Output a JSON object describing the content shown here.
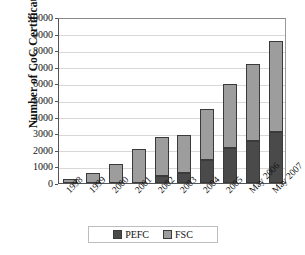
{
  "chart_data": {
    "type": "bar",
    "subtype": "stacked-bar",
    "title": "",
    "xlabel": "",
    "ylabel": "Number of CoC Certificates",
    "ylim": [
      0,
      10000
    ],
    "ytick_step": 1000,
    "yticks": [
      0,
      1000,
      2000,
      3000,
      4000,
      5000,
      6000,
      7000,
      8000,
      9000,
      10000
    ],
    "ytick_labels": [
      "0",
      "1000",
      "2000",
      "3000",
      "4000",
      "5000",
      "6000",
      "7000",
      "8000",
      "9000",
      "10000"
    ],
    "grid": true,
    "grid_axis": "y",
    "legend": [
      "PEFC",
      "FSC"
    ],
    "legend_position": "bottom-center",
    "categories": [
      "1998",
      "1999",
      "2000",
      "2001",
      "2002",
      "2003",
      "2004",
      "2005",
      "May 2006",
      "May 2007"
    ],
    "series": [
      {
        "name": "PEFC",
        "color": "#4a4a4a",
        "values": [
          0,
          0,
          0,
          0,
          430,
          580,
          1380,
          2100,
          2520,
          3100
        ]
      },
      {
        "name": "FSC",
        "color": "#9d9d9d",
        "values": [
          250,
          600,
          1140,
          2030,
          2350,
          2340,
          3070,
          3850,
          4660,
          5450
        ]
      }
    ],
    "totals": [
      250,
      600,
      1140,
      2030,
      2780,
      2920,
      4450,
      5950,
      7180,
      8550
    ]
  },
  "legend": {
    "items": [
      {
        "label": "PEFC",
        "color": "#4a4a4a"
      },
      {
        "label": "FSC",
        "color": "#9d9d9d"
      }
    ]
  },
  "axis": {
    "y_title": "Number of CoC Certificates"
  }
}
